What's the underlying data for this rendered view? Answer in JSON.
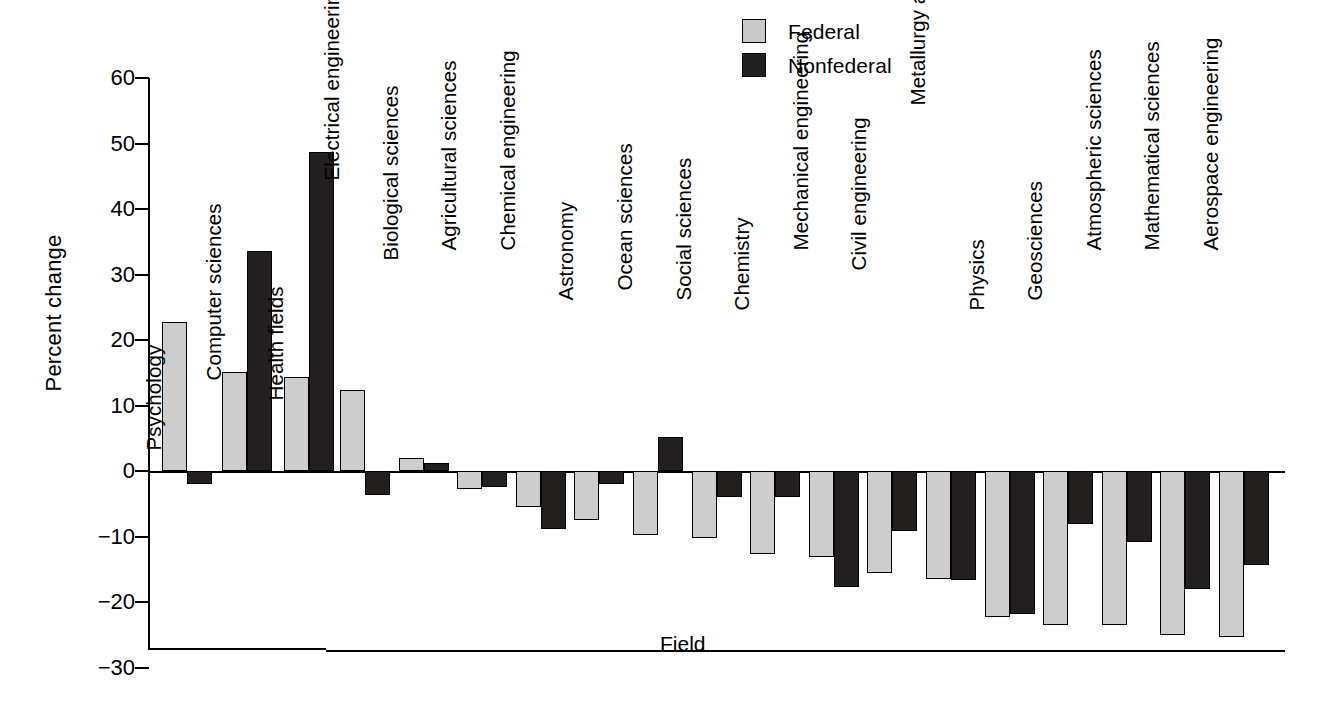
{
  "chart_data": {
    "type": "bar",
    "title": "",
    "xlabel": "Field",
    "ylabel": "Percent change",
    "ylim": [
      -30,
      60
    ],
    "yticks": [
      60,
      50,
      40,
      30,
      20,
      10,
      0,
      -10,
      -20,
      -30
    ],
    "ytick_labels": [
      "60",
      "50",
      "40",
      "30",
      "20",
      "10",
      "0",
      "−10",
      "−20",
      "−30"
    ],
    "grid": false,
    "legend_position": "top-center-right",
    "legend": [
      "Federal",
      "Nonfederal"
    ],
    "colors": {
      "federal": "#cdcdcd",
      "nonfederal": "#231f1f",
      "axis": "#000000"
    },
    "categories": [
      "Psychology",
      "Computer sciences",
      "Health fields",
      "Electrical engineering",
      "Biological sciences",
      "Agricultural sciences",
      "Chemical engineering",
      "Astronomy",
      "Ocean sciences",
      "Social sciences",
      "Chemistry",
      "Mechanical engineering",
      "Civil engineering",
      "Metallurgy and Materials enginering",
      "Physics",
      "Geosciences",
      "Atmospheric sciences",
      "Mathematical sciences",
      "Aerospace engineering"
    ],
    "series": [
      {
        "name": "Federal",
        "values": [
          22.7,
          15.1,
          14.3,
          12.3,
          2.0,
          -2.7,
          -5.5,
          -7.5,
          -9.8,
          -10.2,
          -12.7,
          -13.2,
          -15.5,
          -16.5,
          -22.3,
          -23.5,
          -23.5,
          -25.0,
          -25.3
        ]
      },
      {
        "name": "Nonfederal",
        "values": [
          -2.0,
          33.6,
          48.7,
          -3.6,
          1.2,
          -2.5,
          -8.8,
          -2.0,
          5.2,
          -4.0,
          -4.0,
          -17.7,
          -9.2,
          -16.7,
          -21.8,
          -8.1,
          -10.8,
          -18.0,
          -14.3
        ]
      }
    ]
  },
  "legend": {
    "federal_label": "Federal",
    "nonfederal_label": "Nonfederal"
  },
  "axes": {
    "y_title": "Percent change",
    "x_title": "Field"
  }
}
